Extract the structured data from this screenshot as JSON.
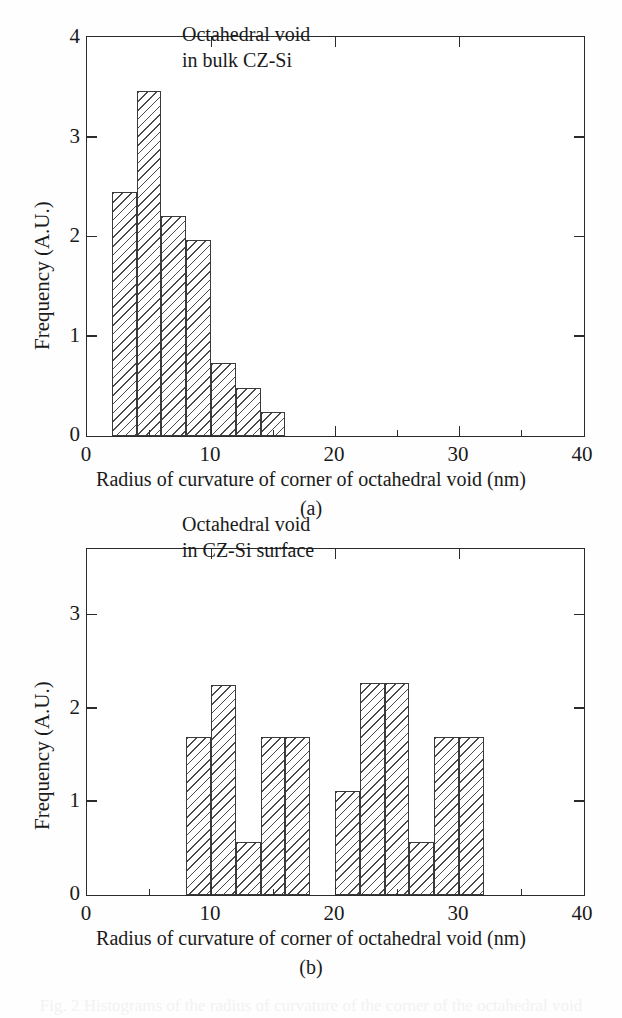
{
  "figure": {
    "panel_letters": [
      "(a)",
      "(b)"
    ],
    "caption_remnant": "Fig. 2  Histograms of the radius of curvature of the corner of the octahedral void"
  },
  "chart_data": [
    {
      "type": "bar",
      "panel": "(a)",
      "title": "",
      "annotation": "Octahedral void\nin bulk CZ-Si",
      "annotation_lines": [
        "Octahedral void",
        "in bulk CZ-Si"
      ],
      "xlabel": "Radius of curvature of corner of octahedral void (nm)",
      "ylabel": "Frequency (A.U.)",
      "xlim": [
        0,
        40
      ],
      "ylim": [
        0,
        4
      ],
      "xticks": [
        0,
        10,
        20,
        30,
        40
      ],
      "xticklabels": [
        "0",
        "10",
        "20",
        "30",
        "40"
      ],
      "xminorticks": [
        5,
        15,
        25,
        35
      ],
      "yticks": [
        0,
        1,
        2,
        3,
        4
      ],
      "yticklabels": [
        "0",
        "1",
        "2",
        "3",
        "4"
      ],
      "grid": false,
      "legend": "none",
      "bin_width": 2,
      "bin_edges": [
        2,
        4,
        6,
        8,
        10,
        12,
        14,
        16
      ],
      "bin_starts": [
        2,
        4,
        6,
        8,
        10,
        12,
        14
      ],
      "values": [
        2.45,
        3.47,
        2.21,
        1.97,
        0.73,
        0.48,
        0.24
      ]
    },
    {
      "type": "bar",
      "panel": "(b)",
      "title": "",
      "annotation": "Octahedral void\nin CZ-Si surface",
      "annotation_lines": [
        "Octahedral void",
        "in CZ-Si surface"
      ],
      "xlabel": "Radius of curvature of corner of octahedral void (nm)",
      "ylabel": "Frequency (A.U.)",
      "xlim": [
        0,
        40
      ],
      "ylim": [
        0,
        3.7
      ],
      "xticks": [
        0,
        10,
        20,
        30,
        40
      ],
      "xticklabels": [
        "0",
        "10",
        "20",
        "30",
        "40"
      ],
      "xminorticks": [
        5,
        15,
        25,
        35
      ],
      "yticks": [
        0,
        1,
        2,
        3
      ],
      "yticklabels": [
        "0",
        "1",
        "2",
        "3"
      ],
      "grid": false,
      "legend": "none",
      "bin_width": 2,
      "bin_starts": [
        8,
        10,
        12,
        14,
        16,
        20,
        22,
        24,
        26,
        28,
        30
      ],
      "values": [
        1.7,
        2.25,
        0.57,
        1.7,
        1.7,
        1.12,
        2.27,
        2.27,
        0.57,
        1.7,
        1.7
      ]
    }
  ]
}
